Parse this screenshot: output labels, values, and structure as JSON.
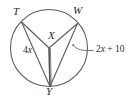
{
  "figure": {
    "type": "circle-geometry-diagram",
    "colors": {
      "stroke": "#5a5a5a",
      "text": "#2b2b2b",
      "background": "#ffffff"
    },
    "circle": {
      "center": {
        "x": 49,
        "y": 48
      },
      "radius": 38.5,
      "center_label": "X"
    },
    "points": [
      {
        "name": "T",
        "label": "T",
        "x": 21.5,
        "y": 22.0,
        "label_x": 13,
        "label_y": 6
      },
      {
        "name": "W",
        "label": "W",
        "x": 77.5,
        "y": 23.5,
        "label_x": 73,
        "label_y": 5
      },
      {
        "name": "Y",
        "label": "Y",
        "x": 50.0,
        "y": 86.5,
        "label_x": 46,
        "label_y": 86
      }
    ],
    "segments": [
      {
        "name": "radius-XT",
        "from": "X",
        "to": "T"
      },
      {
        "name": "radius-XW",
        "from": "X",
        "to": "W"
      },
      {
        "name": "radius-XY",
        "from": "X",
        "to": "Y"
      },
      {
        "name": "chord-TY",
        "from": "T",
        "to": "Y"
      },
      {
        "name": "chord-WY",
        "from": "W",
        "to": "Y"
      }
    ],
    "labels": {
      "center": "X",
      "angle_left": "4x",
      "angle_left_coef": "4",
      "angle_left_var": "x",
      "arc_expression": "2x + 10",
      "arc_expr_prefix": "2",
      "arc_expr_var": "x",
      "arc_expr_suffix": " + 10"
    },
    "leader": {
      "name": "arc-leader-line",
      "from": {
        "x": 93,
        "y": 51
      },
      "to": {
        "x": 75,
        "y": 49
      },
      "tick_x": 88,
      "tick_y": 51
    }
  }
}
